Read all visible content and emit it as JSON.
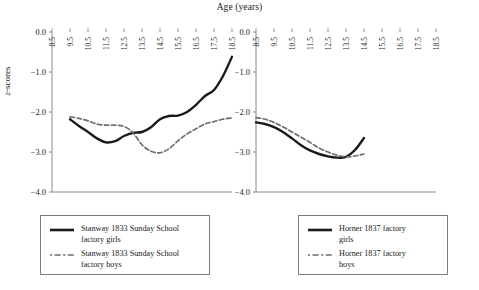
{
  "chart_data": [
    {
      "type": "line",
      "panel": "left",
      "title": "Age (years)",
      "xlabel": "Age (years)",
      "ylabel": "z-scores",
      "xlim": [
        8.5,
        18.5
      ],
      "ylim": [
        -4.0,
        0.0
      ],
      "x_ticks": [
        "8.5",
        "9.5",
        "10.5",
        "11.5",
        "12.5",
        "13.5",
        "14.5",
        "15.5",
        "16.5",
        "17.5",
        "18.5"
      ],
      "y_ticks": [
        "0.0",
        "-1.0",
        "-2.0",
        "-3.0",
        "-4.0"
      ],
      "grid": false,
      "legend_position": "below",
      "series": [
        {
          "name": "Stanway 1833 Sunday School factory girls",
          "style": "solid",
          "color": "#1a1a1a",
          "x": [
            9.5,
            10.0,
            10.5,
            11.0,
            11.5,
            12.0,
            12.5,
            13.0,
            13.5,
            14.0,
            14.5,
            15.0,
            15.5,
            16.0,
            16.5,
            17.0,
            17.5,
            18.0,
            18.5
          ],
          "y": [
            -2.18,
            -2.35,
            -2.5,
            -2.66,
            -2.76,
            -2.73,
            -2.6,
            -2.52,
            -2.5,
            -2.38,
            -2.18,
            -2.1,
            -2.09,
            -2.0,
            -1.82,
            -1.6,
            -1.45,
            -1.1,
            -0.62
          ]
        },
        {
          "name": "Stanway 1833 Sunday School factory boys",
          "style": "dashed",
          "color": "#6e6e6e",
          "x": [
            9.5,
            10.0,
            10.5,
            11.0,
            11.5,
            12.0,
            12.5,
            13.0,
            13.5,
            14.0,
            14.5,
            15.0,
            15.5,
            16.0,
            16.5,
            17.0,
            17.5,
            18.0,
            18.5
          ],
          "y": [
            -2.12,
            -2.16,
            -2.22,
            -2.3,
            -2.33,
            -2.33,
            -2.36,
            -2.52,
            -2.82,
            -2.98,
            -3.02,
            -2.92,
            -2.72,
            -2.55,
            -2.42,
            -2.3,
            -2.24,
            -2.18,
            -2.15
          ]
        }
      ]
    },
    {
      "type": "line",
      "panel": "right",
      "title": "Age (years)",
      "xlabel": "Age (years)",
      "ylabel": "z-scores",
      "xlim": [
        8.5,
        18.5
      ],
      "ylim": [
        -4.0,
        0.0
      ],
      "x_ticks": [
        "8.5",
        "9.5",
        "10.5",
        "11.5",
        "12.5",
        "13.5",
        "14.5",
        "15.5",
        "16.5",
        "17.5",
        "18.5"
      ],
      "y_ticks": [
        "0.0",
        "-1.0",
        "-2.0",
        "-3.0",
        "-4.0"
      ],
      "grid": false,
      "legend_position": "below",
      "series": [
        {
          "name": "Horner 1837 factory girls",
          "style": "solid",
          "color": "#1a1a1a",
          "x": [
            8.5,
            9.0,
            9.5,
            10.0,
            10.5,
            11.0,
            11.5,
            12.0,
            12.5,
            13.0,
            13.5,
            14.0,
            14.5
          ],
          "y": [
            -2.26,
            -2.3,
            -2.38,
            -2.5,
            -2.66,
            -2.83,
            -2.96,
            -3.05,
            -3.11,
            -3.14,
            -3.12,
            -2.95,
            -2.65
          ]
        },
        {
          "name": "Horner 1837 factory boys",
          "style": "dashed",
          "color": "#6e6e6e",
          "x": [
            8.5,
            9.0,
            9.5,
            10.0,
            10.5,
            11.0,
            11.5,
            12.0,
            12.5,
            13.0,
            13.5,
            14.0,
            14.5
          ],
          "y": [
            -2.14,
            -2.18,
            -2.26,
            -2.37,
            -2.5,
            -2.63,
            -2.76,
            -2.9,
            -3.0,
            -3.08,
            -3.12,
            -3.1,
            -3.05
          ]
        }
      ]
    }
  ],
  "figure": {
    "title": "Age (years)",
    "ylabel_italic": "z",
    "ylabel_rest": "-scores"
  },
  "legends": {
    "left": {
      "entries": [
        {
          "label": "Stanway 1833 Sunday School\nfactory girls",
          "style": "solid"
        },
        {
          "label": "Stanway 1833 Sunday School\nfactory boys",
          "style": "dashed"
        }
      ]
    },
    "right": {
      "entries": [
        {
          "label": "Horner 1837 factory\ngirls",
          "style": "solid"
        },
        {
          "label": "Horner 1837 factory\nboys",
          "style": "dashed"
        }
      ]
    }
  }
}
